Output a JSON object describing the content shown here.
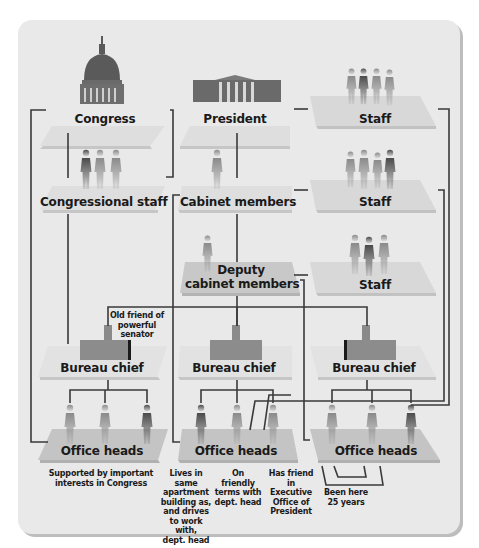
{
  "diagram": {
    "title": "",
    "colors": {
      "background": "#e9e9e9",
      "platform_light": "#dcdcdc",
      "platform_dark": "#c4c4c4",
      "line": "#3a3a3a",
      "figure": "#555555"
    },
    "nodes": {
      "congress": {
        "label": "Congress",
        "icon": "capitol-dome-icon"
      },
      "president": {
        "label": "President",
        "icon": "white-house-icon"
      },
      "president_staff": {
        "label": "Staff",
        "icon": "people-group-icon"
      },
      "congressional_staff": {
        "label": "Congressional staff",
        "icon": "people-group-icon"
      },
      "cabinet_members": {
        "label": "Cabinet members",
        "icon": "person-icon"
      },
      "cabinet_staff": {
        "label": "Staff",
        "icon": "people-group-icon"
      },
      "deputy_cabinet": {
        "label_line1": "Deputy",
        "label_line2": "cabinet members",
        "icon": "person-icon"
      },
      "deputy_staff": {
        "label": "Staff",
        "icon": "people-group-icon"
      },
      "bureau_chief_1": {
        "label": "Bureau chief",
        "icon": "desk-person-icon"
      },
      "bureau_chief_2": {
        "label": "Bureau chief",
        "icon": "desk-person-icon"
      },
      "bureau_chief_3": {
        "label": "Bureau chief",
        "icon": "desk-person-icon"
      },
      "office_heads_1": {
        "label": "Office heads",
        "icon": "people-group-icon"
      },
      "office_heads_2": {
        "label": "Office heads",
        "icon": "people-group-icon"
      },
      "office_heads_3": {
        "label": "Office heads",
        "icon": "people-group-icon"
      }
    },
    "annotations": {
      "old_friend": [
        "Old friend of",
        "powerful",
        "senator"
      ],
      "supported": [
        "Supported by important",
        "interests in Congress"
      ],
      "lives_same": [
        "Lives in same",
        "apartment",
        "building as,",
        "and drives",
        "to work with,",
        "dept. head"
      ],
      "friendly": [
        "On friendly",
        "terms with",
        "dept. head"
      ],
      "has_friend": [
        "Has friend in",
        "Executive",
        "Office of",
        "President"
      ],
      "been_here": [
        "Been here",
        "25 years"
      ]
    }
  }
}
